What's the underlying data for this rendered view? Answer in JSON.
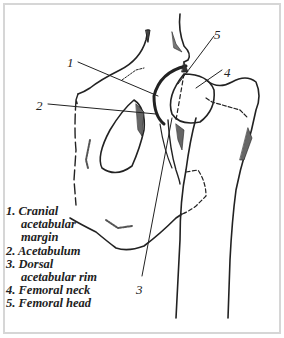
{
  "figure": {
    "callouts": [
      {
        "number": "1",
        "x": 71,
        "y": 59
      },
      {
        "number": "2",
        "x": 38,
        "y": 103
      },
      {
        "number": "3",
        "x": 137,
        "y": 285
      },
      {
        "number": "4",
        "x": 225,
        "y": 66
      },
      {
        "number": "5",
        "x": 216,
        "y": 31
      }
    ]
  },
  "legend": {
    "items": [
      {
        "number": "1.",
        "lines": [
          "Cranial",
          "acetabular",
          "margin"
        ]
      },
      {
        "number": "2.",
        "lines": [
          "Acetabulum"
        ]
      },
      {
        "number": "3.",
        "lines": [
          "Dorsal",
          "acetabular rim"
        ]
      },
      {
        "number": "4.",
        "lines": [
          "Femoral neck"
        ]
      },
      {
        "number": "5.",
        "lines": [
          "Femoral head"
        ]
      }
    ],
    "line_1a": "1. Cranial",
    "line_1b": "acetabular",
    "line_1c": "margin",
    "line_2": "2. Acetabulum",
    "line_3a": "3. Dorsal",
    "line_3b": "acetabular rim",
    "line_4": "4. Femoral neck",
    "line_5": "5. Femoral head"
  },
  "colors": {
    "ink": "#222222",
    "frame": "#d6d6d6",
    "background": "#ffffff"
  }
}
